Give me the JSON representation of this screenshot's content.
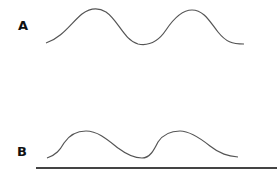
{
  "diagram": {
    "panels": [
      {
        "label": "A",
        "curve": "M46,43 C62,38 72,22 82,14 C90,8 98,7 106,12 C118,20 124,40 138,44 C148,46 158,42 166,30 C174,18 182,10 192,10 C204,10 210,22 218,32 C226,42 232,44 244,44",
        "stroke": "#555555"
      },
      {
        "label": "B",
        "curve": "M47,158 C56,155 60,150 64,143 C70,134 78,131 86,131 C98,131 108,140 118,148 C126,154 134,158 142,158 C150,158 154,150 158,142 C164,133 172,131 180,131 C190,131 200,138 210,146 C220,154 228,156 238,157",
        "stroke": "#555555"
      }
    ],
    "baseline": {
      "x1": 36,
      "y1": 168,
      "x2": 277,
      "y2": 168,
      "stroke": "#444444"
    }
  }
}
